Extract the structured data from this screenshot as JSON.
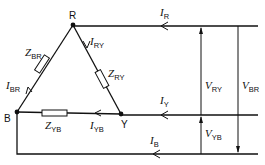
{
  "diagram": {
    "type": "delta-connected three-phase load",
    "nodes": [
      {
        "id": "R",
        "label": "R"
      },
      {
        "id": "Y",
        "label": "Y"
      },
      {
        "id": "B",
        "label": "B"
      }
    ],
    "impedances": [
      {
        "id": "ZBR",
        "symbol": "Z",
        "sub": "BR"
      },
      {
        "id": "ZRY",
        "symbol": "Z",
        "sub": "RY"
      },
      {
        "id": "ZYB",
        "symbol": "Z",
        "sub": "YB"
      }
    ],
    "phase_currents": [
      {
        "id": "IBR",
        "symbol": "I",
        "sub": "BR"
      },
      {
        "id": "IRY",
        "symbol": "I",
        "sub": "RY"
      },
      {
        "id": "IYB",
        "symbol": "I",
        "sub": "YB"
      }
    ],
    "line_currents": [
      {
        "id": "IR",
        "symbol": "I",
        "sub": "R"
      },
      {
        "id": "IY",
        "symbol": "I",
        "sub": "Y"
      },
      {
        "id": "IB",
        "symbol": "I",
        "sub": "B"
      }
    ],
    "line_voltages": [
      {
        "id": "VRY",
        "symbol": "V",
        "sub": "RY"
      },
      {
        "id": "VYB",
        "symbol": "V",
        "sub": "YB"
      },
      {
        "id": "VBR",
        "symbol": "V",
        "sub": "BR"
      }
    ],
    "colors": {
      "line": "#111111",
      "background": "#ffffff"
    }
  }
}
